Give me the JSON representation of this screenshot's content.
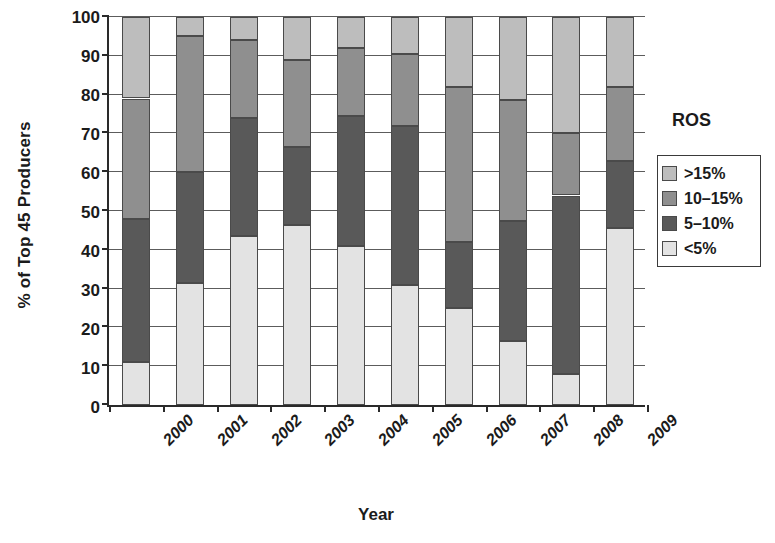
{
  "chart_data": {
    "type": "bar",
    "subtype": "stacked-bar-100-percent",
    "title": "",
    "xlabel": "Year",
    "ylabel": "% of Top 45 Producers",
    "ylim": [
      0,
      100
    ],
    "ytick_step": 10,
    "yticks": [
      0,
      10,
      20,
      30,
      40,
      50,
      60,
      70,
      80,
      90,
      100
    ],
    "grid": true,
    "grid_axis": "y",
    "legend_position": "right",
    "legend_title": "ROS",
    "categories": [
      "2000",
      "2001",
      "2002",
      "2003",
      "2004",
      "2005",
      "2006",
      "2007",
      "2008",
      "2009"
    ],
    "stack_order_bottom_to_top": [
      "<5%",
      "5–10%",
      "10–15%",
      ">15%"
    ],
    "series": [
      {
        "name": "<5%",
        "color": "#e3e3e3",
        "values": [
          11,
          31.5,
          43.5,
          46.5,
          41,
          31,
          25,
          16.5,
          8,
          45.5
        ]
      },
      {
        "name": "5–10%",
        "color": "#595959",
        "values": [
          37,
          28.5,
          30.5,
          20,
          33.5,
          41,
          17,
          31,
          46,
          17.5
        ]
      },
      {
        "name": "10–15%",
        "color": "#8f8f8f",
        "values": [
          31,
          35,
          20,
          22.5,
          17.5,
          18.5,
          40,
          31,
          16,
          19
        ]
      },
      {
        "name": ">15%",
        "color": "#bdbdbd",
        "values": [
          21,
          5,
          6,
          11,
          8,
          9.5,
          18,
          21.5,
          30,
          18
        ]
      }
    ],
    "cumulative_tops": [
      [
        11,
        48,
        79,
        100
      ],
      [
        31.5,
        60,
        95,
        100
      ],
      [
        43.5,
        74,
        94,
        100
      ],
      [
        46.5,
        66.5,
        89,
        100
      ],
      [
        41,
        74.5,
        92,
        100
      ],
      [
        31,
        72,
        90.5,
        100
      ],
      [
        25,
        42,
        82,
        100
      ],
      [
        16.5,
        47.5,
        78.5,
        100
      ],
      [
        8,
        54,
        70,
        100
      ],
      [
        45.5,
        63,
        82,
        100
      ]
    ]
  },
  "axes": {
    "y_title": "% of Top 45 Producers",
    "x_title": "Year",
    "y_tick_labels": [
      "100",
      "90",
      "80",
      "70",
      "60",
      "50",
      "40",
      "30",
      "20",
      "10",
      "0"
    ],
    "x_tick_labels": [
      "2000",
      "2001",
      "2002",
      "2003",
      "2004",
      "2005",
      "2006",
      "2007",
      "2008",
      "2009"
    ]
  },
  "legend": {
    "title": "ROS",
    "items": [
      {
        "label": ">15%",
        "color": "#bdbdbd"
      },
      {
        "label": "10–15%",
        "color": "#8f8f8f"
      },
      {
        "label": "5–10%",
        "color": "#595959"
      },
      {
        "label": "<5%",
        "color": "#e3e3e3"
      }
    ]
  },
  "colors": {
    "axis": "#2a2a2a",
    "gridline": "#5c5c5c",
    "text": "#1b1b1b",
    "background": "#ffffff",
    "segment_border": "#4a4a4a"
  }
}
